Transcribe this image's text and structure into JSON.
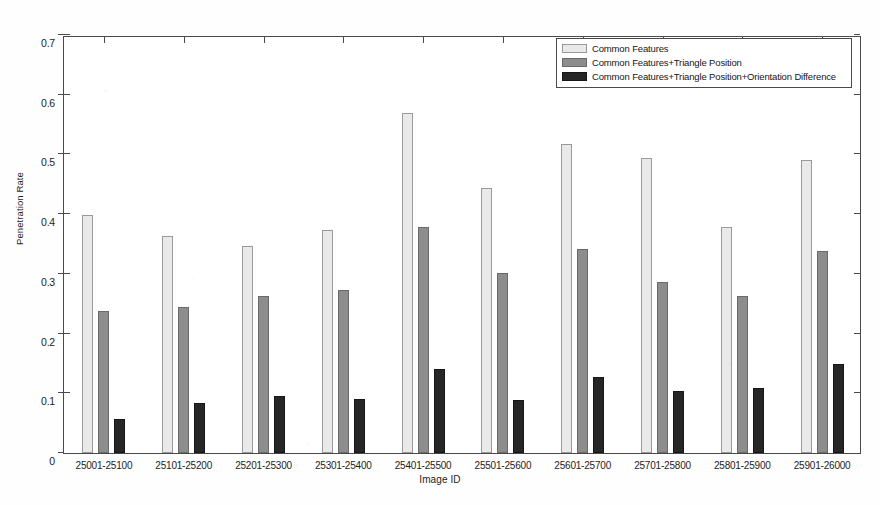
{
  "chart_data": {
    "type": "bar",
    "title": "",
    "xlabel": "Image ID",
    "ylabel": "Penetration Rate",
    "ylim": [
      0,
      0.7
    ],
    "ytick_step": 0.1,
    "yticks": [
      "0",
      "0.1",
      "0.2",
      "0.3",
      "0.4",
      "0.5",
      "0.6",
      "0.7"
    ],
    "grid": false,
    "legend_position": "top-right",
    "categories": [
      "25001-25100",
      "25101-25200",
      "25201-25300",
      "25301-25400",
      "25401-25500",
      "25501-25600",
      "25601-25700",
      "25701-25800",
      "25801-25900",
      "25901-26000"
    ],
    "series": [
      {
        "name": "Common Features",
        "color": "#e9e9e9",
        "values": [
          0.399,
          0.363,
          0.347,
          0.373,
          0.569,
          0.444,
          0.518,
          0.494,
          0.378,
          0.491
        ]
      },
      {
        "name": "Common Features+Triangle Position",
        "color": "#8d8d8d",
        "values": [
          0.238,
          0.244,
          0.263,
          0.273,
          0.379,
          0.302,
          0.342,
          0.287,
          0.263,
          0.338
        ]
      },
      {
        "name": "Common Features+Triangle Position+Orientation Difference",
        "color": "#262626",
        "values": [
          0.057,
          0.084,
          0.095,
          0.09,
          0.14,
          0.088,
          0.127,
          0.104,
          0.109,
          0.149
        ]
      }
    ]
  }
}
